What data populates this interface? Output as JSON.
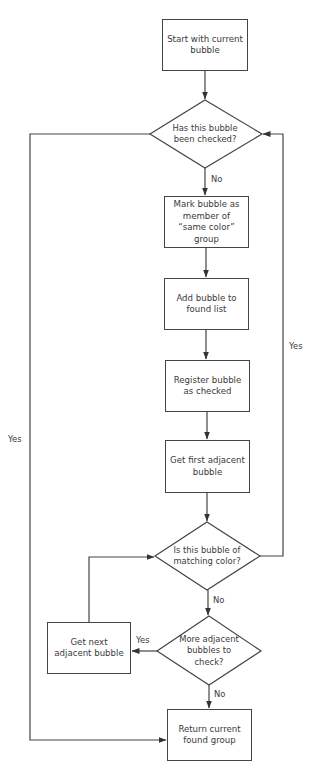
{
  "diagram": {
    "type": "flowchart",
    "nodes": {
      "start": "Start with current bubble",
      "checked_q": "Has this bubble been checked?",
      "mark": "Mark bubble as member of “same color” group",
      "add": "Add bubble to found list",
      "register": "Register bubble as checked",
      "get_first": "Get first adjacent bubble",
      "match_q": "Is this bubble of matching color?",
      "more_q": "More adjacent bubbles to check?",
      "get_next": "Get next adjacent bubble",
      "return": "Return current found group"
    },
    "edge_labels": {
      "checked_no": "No",
      "checked_yes": "Yes",
      "match_yes": "Yes",
      "match_no": "No",
      "more_yes": "Yes",
      "more_no": "No"
    },
    "edges": [
      {
        "from": "start",
        "to": "checked_q",
        "label": ""
      },
      {
        "from": "checked_q",
        "to": "mark",
        "label": "No"
      },
      {
        "from": "checked_q",
        "to": "return",
        "label": "Yes"
      },
      {
        "from": "mark",
        "to": "add",
        "label": ""
      },
      {
        "from": "add",
        "to": "register",
        "label": ""
      },
      {
        "from": "register",
        "to": "get_first",
        "label": ""
      },
      {
        "from": "get_first",
        "to": "match_q",
        "label": ""
      },
      {
        "from": "match_q",
        "to": "checked_q",
        "label": "Yes"
      },
      {
        "from": "match_q",
        "to": "more_q",
        "label": "No"
      },
      {
        "from": "more_q",
        "to": "get_next",
        "label": "Yes"
      },
      {
        "from": "more_q",
        "to": "return",
        "label": "No"
      },
      {
        "from": "get_next",
        "to": "match_q",
        "label": ""
      }
    ],
    "colors": {
      "line": "#444444",
      "text": "#3a3a3a",
      "background": "#ffffff"
    }
  }
}
